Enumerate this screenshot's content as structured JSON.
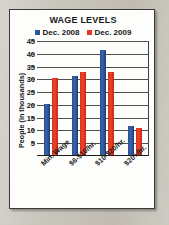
{
  "chart_data": {
    "type": "bar",
    "title": "WAGE LEVELS",
    "xlabel": "",
    "ylabel": "People (in thousands)",
    "categories": [
      "Min. Wage",
      "$6-$10/hr.",
      "$10-$20/hr.",
      "$20+/hr."
    ],
    "series": [
      {
        "name": "Dec. 2008",
        "color": "#2f569b",
        "values": [
          20,
          31,
          41,
          11.5
        ]
      },
      {
        "name": "Dec. 2009",
        "color": "#e23a1f",
        "values": [
          30,
          32.5,
          32.5,
          10.5
        ]
      }
    ],
    "ylim": [
      0,
      45
    ],
    "yticks": [
      45,
      40,
      35,
      30,
      25,
      20,
      15,
      10,
      5
    ],
    "grid": true,
    "legend_position": "top"
  },
  "colors": {
    "series_2008": "#2f569b",
    "series_2009": "#e23a1f",
    "panel_background": "#fdfdfb",
    "page_background": "#c7c3ba",
    "frame": "#3a3a38"
  }
}
